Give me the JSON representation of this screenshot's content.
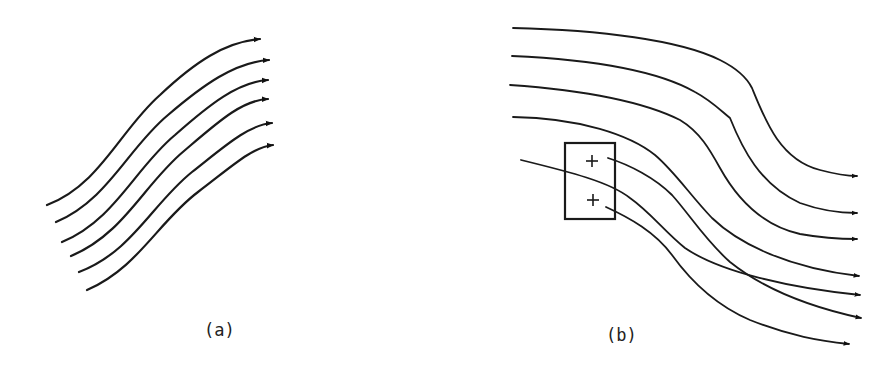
{
  "figure": {
    "panels": [
      {
        "id": "a",
        "label": "(a)",
        "description": "Six parallel curved streamlines with arrowheads, rising to the right",
        "streamline_count": 6
      },
      {
        "id": "b",
        "label": "(b)",
        "description": "Seven streamlines bending downward to the right; a rectangular box containing two plus signs sits in the flow, with streamlines originating from the plus signs",
        "streamline_count": 7,
        "box": {
          "markers": [
            "+",
            "+"
          ]
        }
      }
    ]
  },
  "colors": {
    "ink": "#1a1a1a",
    "background": "#ffffff"
  }
}
